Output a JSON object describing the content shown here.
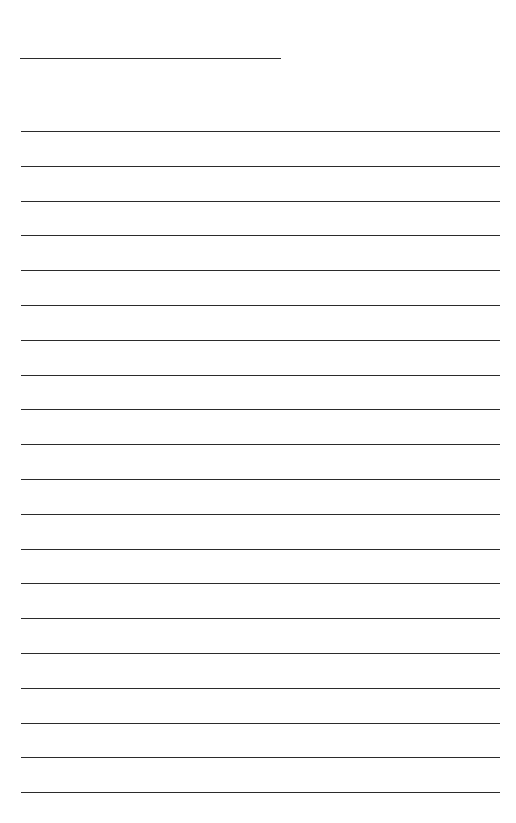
{
  "document": {
    "type": "lined-paper",
    "background_color": "#ffffff",
    "line_color": "#2b2b2b",
    "title_line": {
      "text": "",
      "y": 58,
      "x_start": 20,
      "x_end": 281
    },
    "writing_lines": {
      "count": 20,
      "first_y": 131,
      "spacing": 34.8,
      "x_start": 21,
      "x_end": 500,
      "entries": [
        "",
        "",
        "",
        "",
        "",
        "",
        "",
        "",
        "",
        "",
        "",
        "",
        "",
        "",
        "",
        "",
        "",
        "",
        "",
        ""
      ]
    }
  }
}
